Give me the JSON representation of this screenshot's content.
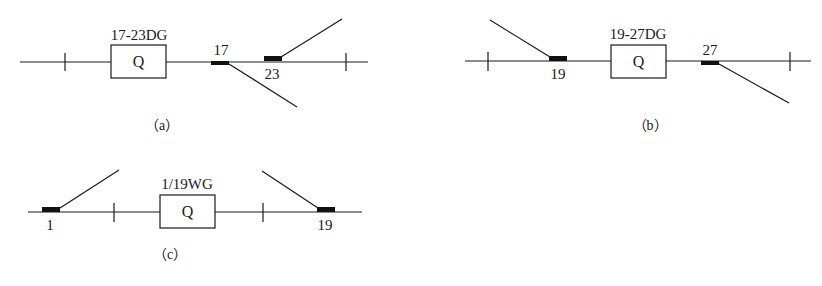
{
  "diagrams": {
    "a": {
      "caption": "（a）",
      "section_label": "17-23DG",
      "box_label": "Q",
      "switches": [
        {
          "number": "17"
        },
        {
          "number": "23"
        }
      ]
    },
    "b": {
      "caption": "（b）",
      "section_label": "19-27DG",
      "box_label": "Q",
      "switches": [
        {
          "number": "19"
        },
        {
          "number": "27"
        }
      ]
    },
    "c": {
      "caption": "（c）",
      "section_label": "1/19WG",
      "box_label": "Q",
      "switches": [
        {
          "number": "1"
        },
        {
          "number": "19"
        }
      ]
    }
  }
}
